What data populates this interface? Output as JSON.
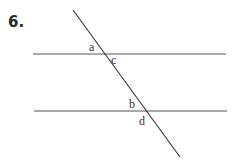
{
  "problem": {
    "number": "6."
  },
  "diagram": {
    "line_color": "#555555",
    "angle_labels": [
      {
        "id": "a",
        "text": "a"
      },
      {
        "id": "c",
        "text": "c"
      },
      {
        "id": "b",
        "text": "b"
      },
      {
        "id": "d",
        "text": "d"
      }
    ]
  }
}
